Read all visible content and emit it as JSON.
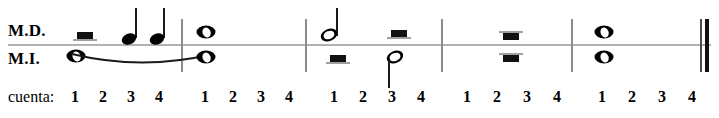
{
  "staff": {
    "hand_upper_label": "M.D.",
    "hand_lower_label": "M.I.",
    "line_color": "#b2b2b2",
    "barline_color": "#8c8c8c",
    "ink_color": "#000000"
  },
  "count": {
    "caption": "cuenta:",
    "beats_per_measure": 4,
    "numbers": [
      "1",
      "2",
      "3",
      "4"
    ]
  },
  "measures": [
    {
      "index": 1,
      "counts": [
        "1",
        "2",
        "3",
        "4"
      ],
      "upper": [
        {
          "beat": 1,
          "symbol": "half-rest"
        },
        {
          "beat": 3,
          "symbol": "quarter-note"
        },
        {
          "beat": 4,
          "symbol": "quarter-note"
        }
      ],
      "lower": [
        {
          "beat": 1,
          "symbol": "whole-note",
          "tied": true
        }
      ]
    },
    {
      "index": 2,
      "counts": [
        "1",
        "2",
        "3",
        "4"
      ],
      "upper": [
        {
          "beat": 1,
          "symbol": "whole-note"
        }
      ],
      "lower": [
        {
          "beat": 1,
          "symbol": "whole-note",
          "tied": true
        }
      ]
    },
    {
      "index": 3,
      "counts": [
        "1",
        "2",
        "3",
        "4"
      ],
      "upper": [
        {
          "beat": 1,
          "symbol": "half-note"
        },
        {
          "beat": 3,
          "symbol": "half-rest"
        }
      ],
      "lower": [
        {
          "beat": 1,
          "symbol": "half-rest"
        },
        {
          "beat": 3,
          "symbol": "half-note"
        }
      ]
    },
    {
      "index": 4,
      "counts": [
        "1",
        "2",
        "3",
        "4"
      ],
      "upper": [
        {
          "beat": 2,
          "symbol": "whole-rest"
        }
      ],
      "lower": [
        {
          "beat": 2,
          "symbol": "whole-rest"
        }
      ]
    },
    {
      "index": 5,
      "counts": [
        "1",
        "2",
        "3",
        "4"
      ],
      "upper": [
        {
          "beat": 1,
          "symbol": "whole-note"
        }
      ],
      "lower": [
        {
          "beat": 1,
          "symbol": "whole-note"
        }
      ]
    }
  ],
  "counts_flat": [
    "1",
    "2",
    "3",
    "4",
    "1",
    "2",
    "3",
    "4",
    "1",
    "2",
    "3",
    "4",
    "1",
    "2",
    "3",
    "4",
    "1",
    "2",
    "3",
    "4"
  ]
}
